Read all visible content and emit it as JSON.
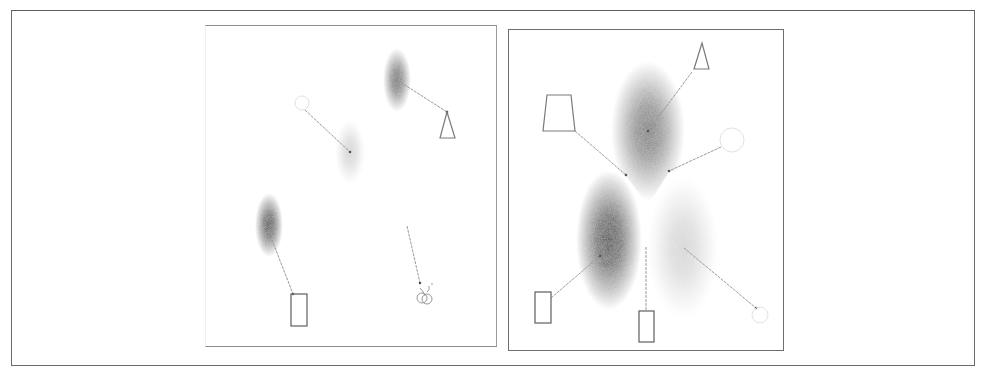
{
  "figure": {
    "panels": [
      {
        "id": "left",
        "blobs": [
          {
            "cx": 397,
            "cy": 80,
            "rx": 14,
            "ry": 32,
            "intensity": 0.78
          },
          {
            "cx": 350,
            "cy": 152,
            "rx": 15,
            "ry": 32,
            "intensity": 0.22
          },
          {
            "cx": 269,
            "cy": 225,
            "rx": 14,
            "ry": 32,
            "intensity": 0.95
          }
        ],
        "links": [
          {
            "x1": 397,
            "y1": 80,
            "x2": 447,
            "y2": 112
          },
          {
            "x1": 305,
            "y1": 110,
            "x2": 350,
            "y2": 152
          },
          {
            "x1": 272,
            "y1": 240,
            "x2": 293,
            "y2": 294
          },
          {
            "x1": 407,
            "y1": 226,
            "x2": 420,
            "y2": 283
          }
        ],
        "shapes": [
          {
            "type": "triangle",
            "points": "447,112 440,138 455,138"
          },
          {
            "type": "circle",
            "cx": 302,
            "cy": 103,
            "r": 7,
            "faint": true
          },
          {
            "type": "rect",
            "x": 291,
            "y": 294,
            "w": 16,
            "h": 32
          },
          {
            "type": "squiggle",
            "cx": 425,
            "cy": 296
          }
        ]
      },
      {
        "id": "right",
        "blobs": [
          {
            "cx": 648,
            "cy": 131,
            "rx": 37,
            "ry": 70,
            "intensity": 0.72
          },
          {
            "cx": 609,
            "cy": 240,
            "rx": 33,
            "ry": 70,
            "intensity": 0.98
          },
          {
            "cx": 683,
            "cy": 248,
            "rx": 35,
            "ry": 70,
            "intensity": 0.22
          }
        ],
        "links": [
          {
            "x1": 575,
            "y1": 131,
            "x2": 626,
            "y2": 175
          },
          {
            "x1": 692,
            "y1": 72,
            "x2": 648,
            "y2": 131
          },
          {
            "x1": 721,
            "y1": 147,
            "x2": 669,
            "y2": 171
          },
          {
            "x1": 551,
            "y1": 298,
            "x2": 600,
            "y2": 256
          },
          {
            "x1": 646,
            "y1": 247,
            "x2": 646,
            "y2": 311
          },
          {
            "x1": 684,
            "y1": 248,
            "x2": 756,
            "y2": 308
          }
        ],
        "shapes": [
          {
            "type": "trapezoid",
            "points": "547,95 571,95 575,131 543,131"
          },
          {
            "type": "triangle",
            "points": "702,43 694,69 709,69"
          },
          {
            "type": "circle",
            "cx": 732,
            "cy": 140,
            "r": 12,
            "faint": true
          },
          {
            "type": "rect",
            "x": 535,
            "y": 292,
            "w": 16,
            "h": 31
          },
          {
            "type": "rect",
            "x": 639,
            "y": 311,
            "w": 15,
            "h": 31
          },
          {
            "type": "circle",
            "cx": 760,
            "cy": 315,
            "r": 8,
            "faint": true
          }
        ]
      }
    ],
    "colors": {
      "frame": "#6a6a6a",
      "shape_stroke": "#7a7a7a",
      "link_stroke": "#9a9a9a",
      "blob_core": "#1e1e1e"
    }
  }
}
